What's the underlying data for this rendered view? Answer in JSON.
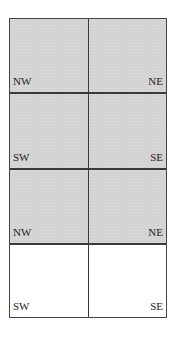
{
  "diagram": {
    "type": "quadrant-grid",
    "rows": [
      {
        "shaded": true,
        "left_label": "NW",
        "right_label": "NE"
      },
      {
        "shaded": true,
        "left_label": "SW",
        "right_label": "SE"
      },
      {
        "shaded": true,
        "left_label": "NW",
        "right_label": "NE"
      },
      {
        "shaded": false,
        "left_label": "SW",
        "right_label": "SE"
      }
    ],
    "colors": {
      "shaded": "#d3d3d3",
      "blank": "#ffffff",
      "line": "#3a3a3a"
    }
  }
}
